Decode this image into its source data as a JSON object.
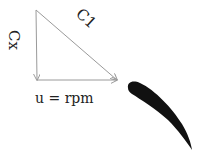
{
  "diagram": {
    "type": "velocity-triangle",
    "labels": {
      "axial_velocity": "Cx",
      "absolute_velocity": "C1",
      "blade_speed": "u = rpm"
    },
    "colors": {
      "vector_lines": "#9a9a9a",
      "text": "#222222",
      "blade": "#111111",
      "background": "#ffffff"
    },
    "vectors": [
      {
        "name": "Cx",
        "from": [
          36,
          10
        ],
        "to": [
          37,
          80
        ],
        "direction": "down"
      },
      {
        "name": "u",
        "from": [
          37,
          80
        ],
        "to": [
          117,
          80
        ],
        "direction": "right"
      },
      {
        "name": "C1",
        "from": [
          36,
          10
        ],
        "to": [
          117,
          80
        ],
        "direction": "down-right"
      }
    ],
    "blade": {
      "shape": "airfoil",
      "leading_edge": [
        128,
        86
      ],
      "trailing_edge": [
        192,
        150
      ]
    }
  }
}
